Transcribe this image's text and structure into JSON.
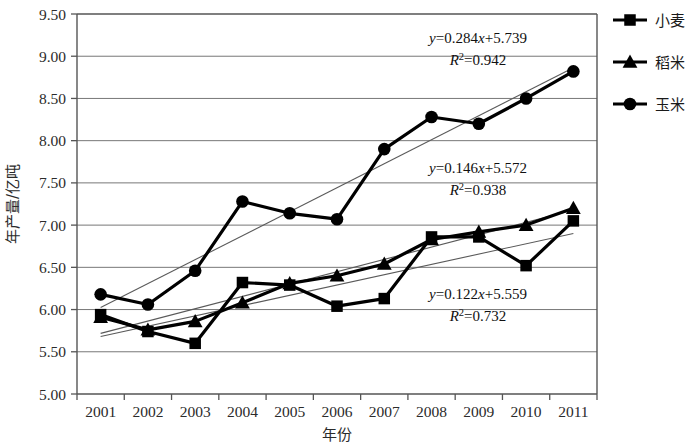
{
  "chart_data": {
    "type": "line",
    "title": "",
    "xlabel": "年份",
    "ylabel": "年产量/亿吨",
    "categories": [
      "2001",
      "2002",
      "2003",
      "2004",
      "2005",
      "2006",
      "2007",
      "2008",
      "2009",
      "2010",
      "2011"
    ],
    "ylim": [
      5.0,
      9.5
    ],
    "ytick_step": 0.5,
    "ytick_labels": [
      "5.00",
      "5.50",
      "6.00",
      "6.50",
      "7.00",
      "7.50",
      "8.00",
      "8.50",
      "9.00",
      "9.50"
    ],
    "grid": "horizontal",
    "legend_position": "right-top",
    "series": [
      {
        "name": "小麦",
        "marker": "square",
        "color": "#000000",
        "values": [
          5.94,
          5.74,
          5.6,
          6.32,
          6.29,
          6.04,
          6.13,
          6.86,
          6.86,
          6.52,
          7.05
        ],
        "trendline": {
          "slope": 0.122,
          "intercept": 5.559,
          "r2": 0.732
        }
      },
      {
        "name": "稻米",
        "marker": "triangle",
        "color": "#000000",
        "values": [
          5.91,
          5.76,
          5.86,
          6.08,
          6.31,
          6.4,
          6.54,
          6.83,
          6.92,
          7.0,
          7.2
        ],
        "trendline": {
          "slope": 0.146,
          "intercept": 5.572,
          "r2": 0.938
        }
      },
      {
        "name": "玉米",
        "marker": "circle",
        "color": "#000000",
        "values": [
          6.18,
          6.06,
          6.46,
          7.28,
          7.14,
          7.07,
          7.9,
          8.28,
          8.2,
          8.5,
          8.82
        ],
        "trendline": {
          "slope": 0.284,
          "intercept": 5.739,
          "r2": 0.942
        }
      }
    ],
    "annotations": [
      {
        "id": "corn-eq",
        "equation": "y=0.284x+5.739",
        "r2": "R2=0.942",
        "r2_base": "R",
        "r2_sup": "2",
        "r2_value": "=0.942"
      },
      {
        "id": "rice-eq",
        "equation": "y=0.146x+5.572",
        "r2": "R2=0.938",
        "r2_base": "R",
        "r2_sup": "2",
        "r2_value": "=0.938"
      },
      {
        "id": "wheat-eq",
        "equation": "y=0.122x+5.559",
        "r2": "R2=0.732",
        "r2_base": "R",
        "r2_sup": "2",
        "r2_value": "=0.732"
      }
    ]
  },
  "axes": {
    "y_title": "年产量/亿吨",
    "x_title": "年份",
    "y_ticks": [
      "9.50",
      "9.00",
      "8.50",
      "8.00",
      "7.50",
      "7.00",
      "6.50",
      "6.00",
      "5.50",
      "5.00"
    ],
    "x_ticks": [
      "2001",
      "2002",
      "2003",
      "2004",
      "2005",
      "2006",
      "2007",
      "2008",
      "2009",
      "2010",
      "2011"
    ]
  },
  "legend": {
    "items": [
      {
        "label": "小麦",
        "marker": "square"
      },
      {
        "label": "稻米",
        "marker": "triangle"
      },
      {
        "label": "玉米",
        "marker": "circle"
      }
    ]
  },
  "equations": {
    "corn": {
      "line1_a": "y",
      "line1_b": "=0.284",
      "line1_c": "x",
      "line1_d": "+5.739",
      "line2_a": "R",
      "line2_sup": "2",
      "line2_b": "=0.942"
    },
    "rice": {
      "line1_a": "y",
      "line1_b": "=0.146",
      "line1_c": "x",
      "line1_d": "+5.572",
      "line2_a": "R",
      "line2_sup": "2",
      "line2_b": "=0.938"
    },
    "wheat": {
      "line1_a": "y",
      "line1_b": "=0.122",
      "line1_c": "x",
      "line1_d": "+5.559",
      "line2_a": "R",
      "line2_sup": "2",
      "line2_b": "=0.732"
    }
  }
}
